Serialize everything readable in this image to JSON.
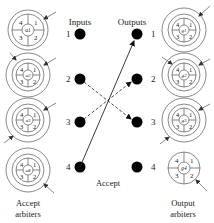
{
  "labels": {
    "inputs": "Inputs",
    "outputs": "Outputs",
    "accept": "Accept",
    "accept_arbiters_line1": "Accept",
    "accept_arbiters_line2": "arbiters",
    "output_arbiters_line1": "Output",
    "output_arbiters_line2": "arbiters"
  },
  "inputs": [
    {
      "id": "1",
      "label": "1"
    },
    {
      "id": "2",
      "label": "2"
    },
    {
      "id": "3",
      "label": "3"
    },
    {
      "id": "4",
      "label": "4"
    }
  ],
  "outputs": [
    {
      "id": "1",
      "label": "1"
    },
    {
      "id": "2",
      "label": "2"
    },
    {
      "id": "3",
      "label": "3"
    },
    {
      "id": "4",
      "label": "4"
    }
  ],
  "accept_arbiters": [
    {
      "name": "a1",
      "sectors": [
        "1",
        "2",
        "3",
        "4"
      ],
      "outer_ring": false
    },
    {
      "name": "a2",
      "sectors": [
        "1",
        "2",
        "3",
        "4"
      ],
      "outer_ring": true
    },
    {
      "name": "a3",
      "sectors": [
        "1",
        "2",
        "3",
        "4"
      ],
      "outer_ring": true
    },
    {
      "name": "a4",
      "sectors": [
        "1",
        "2",
        "3",
        "4"
      ],
      "outer_ring": true
    }
  ],
  "output_arbiters": [
    {
      "name": "g1",
      "sectors": [
        "1",
        "2",
        "3",
        "4"
      ],
      "outer_ring": true
    },
    {
      "name": "g2",
      "sectors": [
        "1",
        "2",
        "3",
        "4"
      ],
      "outer_ring": true
    },
    {
      "name": "g3",
      "sectors": [
        "1",
        "2",
        "3",
        "4"
      ],
      "outer_ring": true
    },
    {
      "name": "g4",
      "sectors": [
        "1",
        "2",
        "3",
        "4"
      ],
      "outer_ring": false
    }
  ],
  "connections": [
    {
      "from": "input-4",
      "to": "output-1",
      "style": "solid",
      "meaning": "accept"
    },
    {
      "from": "input-2",
      "to": "output-3",
      "style": "dashed",
      "meaning": "request"
    },
    {
      "from": "input-3",
      "to": "output-2",
      "style": "dashed",
      "meaning": "request"
    }
  ]
}
